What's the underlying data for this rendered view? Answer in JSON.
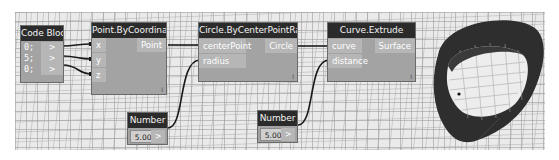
{
  "workspace": {
    "background_color": "#eaeaea",
    "node_header_color": "#2b2b2b",
    "node_body_color": "#a3a3a3",
    "wire_color": "#1a1a1a"
  },
  "nodes": {
    "code_block": {
      "title": "Code Block",
      "lines": [
        "0;",
        "5;",
        "0;"
      ],
      "outputs": [
        ">",
        ">",
        ">"
      ]
    },
    "point_by_coordinates": {
      "title": "Point.ByCoordinates",
      "inputs": [
        "x",
        "y",
        "z"
      ],
      "output": "Point",
      "lacing": "l"
    },
    "number_1": {
      "title": "Number",
      "value": "5.000",
      "output": ">"
    },
    "circle_by_center_point_radius": {
      "title": "Circle.ByCenterPointRadius",
      "inputs": [
        "centerPoint",
        "radius"
      ],
      "output": "Circle",
      "lacing": "l"
    },
    "number_2": {
      "title": "Number",
      "value": "5.000",
      "output": ">"
    },
    "curve_extrude": {
      "title": "Curve.Extrude",
      "inputs": [
        "curve",
        "distance"
      ],
      "output": "Surface",
      "lacing": "l"
    }
  },
  "preview": {
    "geometry": "extruded-cylinder-surface",
    "color": "#2e2e2e"
  }
}
